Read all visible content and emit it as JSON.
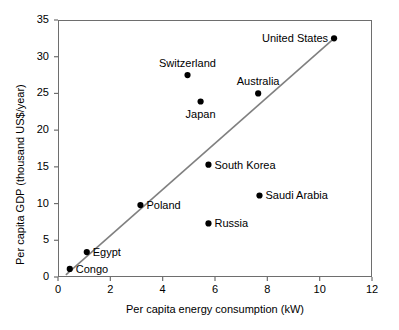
{
  "chart_data": {
    "type": "scatter",
    "title": "",
    "xlabel": "Per capita energy consumption (kW)",
    "ylabel": "Per capita GDP (thousand US$/year)",
    "xlim": [
      0,
      12
    ],
    "ylim": [
      0,
      35
    ],
    "xticks": [
      0,
      2,
      4,
      6,
      8,
      10,
      12
    ],
    "yticks": [
      0,
      5,
      10,
      15,
      20,
      25,
      30,
      35
    ],
    "xtick_labels": [
      "0",
      "2",
      "4",
      "6",
      "8",
      "10",
      "12"
    ],
    "ytick_labels": [
      "0",
      "5",
      "10",
      "15",
      "20",
      "25",
      "30",
      "35"
    ],
    "grid": false,
    "legend": "none",
    "point_color": "#000000",
    "line_color": "#808080",
    "frame_color": "#6e6e6e",
    "points": [
      {
        "label": "Congo",
        "x": 0.45,
        "y": 1.1,
        "label_pos": "right"
      },
      {
        "label": "Egypt",
        "x": 1.1,
        "y": 3.4,
        "label_pos": "right"
      },
      {
        "label": "Poland",
        "x": 3.15,
        "y": 9.8,
        "label_pos": "right"
      },
      {
        "label": "Switzerland",
        "x": 4.95,
        "y": 27.5,
        "label_pos": "above"
      },
      {
        "label": "Japan",
        "x": 5.45,
        "y": 23.9,
        "label_pos": "below"
      },
      {
        "label": "South Korea",
        "x": 5.75,
        "y": 15.3,
        "label_pos": "right"
      },
      {
        "label": "Russia",
        "x": 5.75,
        "y": 7.3,
        "label_pos": "right"
      },
      {
        "label": "Australia",
        "x": 7.65,
        "y": 25.0,
        "label_pos": "above"
      },
      {
        "label": "Saudi Arabia",
        "x": 7.7,
        "y": 11.1,
        "label_pos": "right"
      },
      {
        "label": "United States",
        "x": 10.55,
        "y": 32.5,
        "label_pos": "left"
      }
    ],
    "trend_line": {
      "x0": 0.3,
      "y0": 0.3,
      "x1": 10.55,
      "y1": 32.5
    }
  }
}
